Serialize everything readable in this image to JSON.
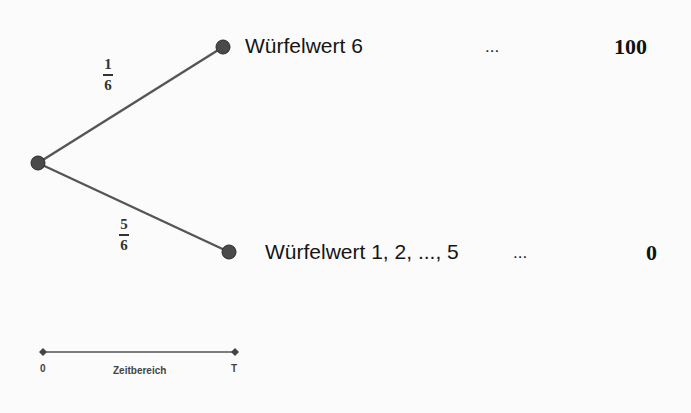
{
  "tree": {
    "root": {
      "label": ""
    },
    "branches": [
      {
        "probability": {
          "numerator": "1",
          "denominator": "6"
        },
        "outcome": "Würfelwert 6",
        "ellipsis": "...",
        "payoff": "100"
      },
      {
        "probability": {
          "numerator": "5",
          "denominator": "6"
        },
        "outcome": "Würfelwert 1, 2, ..., 5",
        "ellipsis": "...",
        "payoff": "0"
      }
    ]
  },
  "timeline": {
    "start_label": "0",
    "end_label": "T",
    "caption": "Zeitbereich"
  },
  "colors": {
    "edge": "#555555",
    "node": "#4a4a4a",
    "background": "#fbfbfb"
  }
}
